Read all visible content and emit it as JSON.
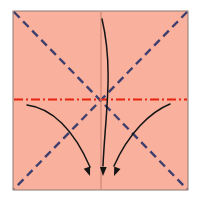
{
  "diagram": {
    "type": "origami-fold-diagram",
    "canvas": {
      "width": 202,
      "height": 200,
      "background": "#ffffff"
    },
    "paper": {
      "label": "paper-square",
      "shape": "square",
      "x": 13,
      "y": 11,
      "width": 175,
      "height": 179,
      "fill": "#f9b09c",
      "stroke": "#8b7a72",
      "stroke_width": 1
    },
    "creases": [
      {
        "name": "diagonal-crease-tl-br",
        "style": "dashed",
        "color": "#3f3f6e",
        "width": 2.4,
        "dash": "8,5",
        "x1": 14,
        "y1": 12,
        "x2": 187,
        "y2": 189
      },
      {
        "name": "diagonal-crease-tr-bl",
        "style": "dashed",
        "color": "#3f3f6e",
        "width": 2.4,
        "dash": "8,5",
        "x1": 187,
        "y1": 12,
        "x2": 14,
        "y2": 189
      },
      {
        "name": "horizontal-centerline",
        "style": "dash-dot",
        "color": "#e8230f",
        "width": 1.8,
        "dash": "9,3,2,3",
        "x1": 14,
        "y1": 99.5,
        "x2": 187,
        "y2": 99.5
      },
      {
        "name": "vertical-centerline",
        "style": "solid",
        "color": "#c98878",
        "width": 1.2,
        "dash": "none",
        "x1": 101,
        "y1": 12,
        "x2": 101,
        "y2": 189
      }
    ],
    "arrows": [
      {
        "name": "fold-arrow-left",
        "color": "#151515",
        "width": 1.5,
        "path": "M 27,105 C 52,108 74,130 90,167",
        "head": {
          "x": 90,
          "y": 176,
          "angle": 70
        }
      },
      {
        "name": "fold-arrow-center",
        "color": "#151515",
        "width": 1.5,
        "path": "M 102,19 C 114,70 105,116 103,166",
        "head": {
          "x": 103,
          "y": 176,
          "angle": 92
        }
      },
      {
        "name": "fold-arrow-right",
        "color": "#151515",
        "width": 1.5,
        "path": "M 170,104 C 150,112 128,134 114,166",
        "head": {
          "x": 114,
          "y": 176,
          "angle": 112
        }
      }
    ],
    "arrowhead": {
      "name": "arrowhead-marker",
      "length": 9,
      "half_width": 3.4,
      "color": "#151515"
    },
    "legend": {
      "mountain_valley_dash_color": "#3f3f6e",
      "center_line_color": "#e8230f",
      "paper_color": "#f9b09c",
      "arrow_color": "#151515"
    }
  }
}
